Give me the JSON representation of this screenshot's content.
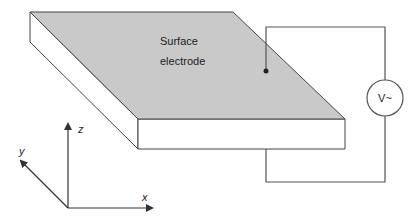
{
  "diagram": {
    "electrode_label_line1": "Surface",
    "electrode_label_line2": "electrode",
    "source_label": "V~",
    "axes": {
      "x": "x",
      "y": "y",
      "z": "z"
    }
  },
  "colors": {
    "electrode_fill": "#c9c9c9",
    "slab_fill": "#ffffff",
    "stroke": "#444444",
    "wire": "#555555"
  }
}
